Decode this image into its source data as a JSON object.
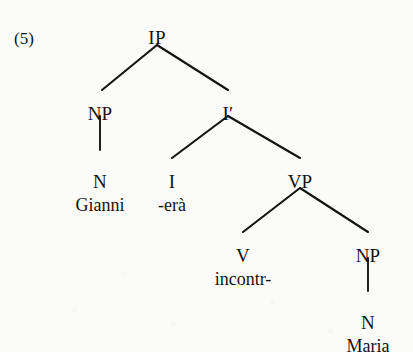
{
  "figure": {
    "example_label": "(5)",
    "language": "Italian",
    "ink_color": "#131313",
    "page_color": "#fbfbfa"
  },
  "tree": {
    "nodes": [
      {
        "id": "IP",
        "label": "IP",
        "x": 157,
        "y": 28
      },
      {
        "id": "NP1",
        "label": "NP",
        "x": 100,
        "y": 104
      },
      {
        "id": "Ibar",
        "label": "I′",
        "x": 228,
        "y": 104
      },
      {
        "id": "N1",
        "label": "N",
        "x": 100,
        "y": 172
      },
      {
        "id": "I",
        "label": "I",
        "x": 172,
        "y": 172
      },
      {
        "id": "VP",
        "label": "VP",
        "x": 300,
        "y": 172
      },
      {
        "id": "V",
        "label": "V",
        "x": 243,
        "y": 246
      },
      {
        "id": "NP2",
        "label": "NP",
        "x": 368,
        "y": 246
      },
      {
        "id": "N2",
        "label": "N",
        "x": 368,
        "y": 313
      }
    ],
    "words": [
      {
        "id": "w-gianni",
        "text": "Gianni",
        "x": 100,
        "y": 196
      },
      {
        "id": "w-era",
        "text": "-erà",
        "x": 172,
        "y": 196
      },
      {
        "id": "w-incontr",
        "text": "incontr-",
        "x": 243,
        "y": 270
      },
      {
        "id": "w-maria",
        "text": "Maria",
        "x": 368,
        "y": 337
      }
    ],
    "edges": [
      {
        "id": "ip-np",
        "from": "IP",
        "to": "NP1",
        "x1": 157,
        "y1": 45,
        "x2": 102,
        "y2": 90,
        "kind": "branch"
      },
      {
        "id": "ip-ibar",
        "from": "IP",
        "to": "Ibar",
        "x1": 157,
        "y1": 45,
        "x2": 228,
        "y2": 90,
        "kind": "branch"
      },
      {
        "id": "np-n",
        "from": "NP1",
        "to": "N1",
        "x1": 100,
        "y1": 116,
        "x2": 100,
        "y2": 150,
        "kind": "stem"
      },
      {
        "id": "ibar-i",
        "from": "Ibar",
        "to": "I",
        "x1": 228,
        "y1": 116,
        "x2": 172,
        "y2": 158,
        "kind": "branch"
      },
      {
        "id": "ibar-vp",
        "from": "Ibar",
        "to": "VP",
        "x1": 228,
        "y1": 116,
        "x2": 300,
        "y2": 158,
        "kind": "branch"
      },
      {
        "id": "vp-v",
        "from": "VP",
        "to": "V",
        "x1": 300,
        "y1": 188,
        "x2": 243,
        "y2": 232,
        "kind": "branch"
      },
      {
        "id": "vp-np",
        "from": "VP",
        "to": "NP2",
        "x1": 300,
        "y1": 188,
        "x2": 368,
        "y2": 232,
        "kind": "branch"
      },
      {
        "id": "np2-n2",
        "from": "NP2",
        "to": "N2",
        "x1": 368,
        "y1": 258,
        "x2": 368,
        "y2": 291,
        "kind": "stem"
      }
    ]
  }
}
